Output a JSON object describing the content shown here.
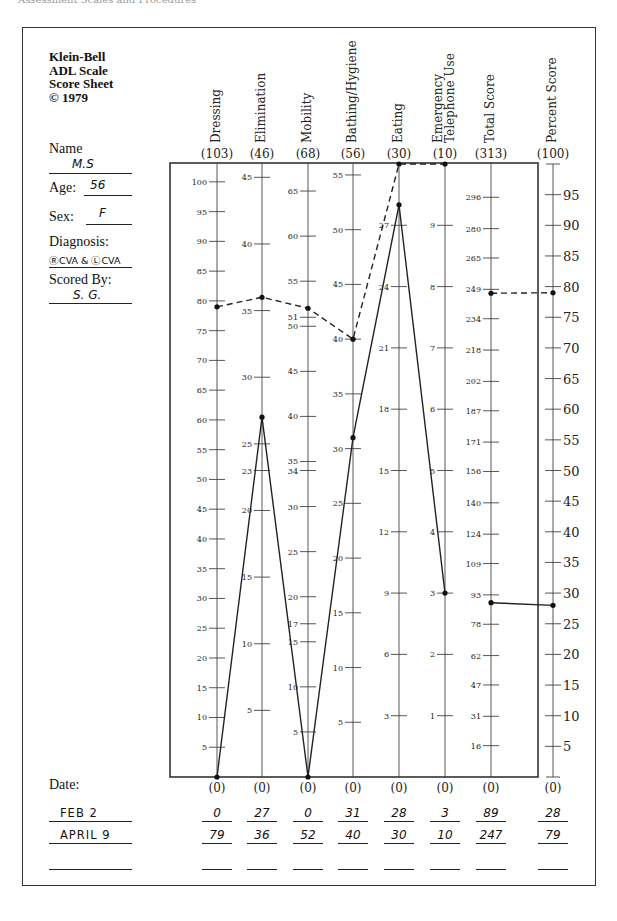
{
  "running_head": "Assessment Scales and Procedures",
  "sheet": {
    "title_lines": [
      "Klein-Bell",
      "ADL Scale",
      "Score Sheet",
      "© 1979"
    ],
    "name_label": "Name",
    "name_value": "M.S",
    "age_label": "Age:",
    "age_value": "56",
    "sex_label": "Sex:",
    "sex_value": "F",
    "diagnosis_label": "Diagnosis:",
    "diagnosis_value": "ⓇCVA & ⓁCVA",
    "scored_by_label": "Scored By:",
    "scored_by_value": "S. G.",
    "date_label": "Date:",
    "zero_label": "(0)"
  },
  "chart_data": {
    "type": "line",
    "title": "Klein-Bell ADL Scale Score Sheet",
    "xlabel": "",
    "ylabel": "",
    "grid": false,
    "legend": "none (rows identified by date at bottom)",
    "categories": [
      "Dressing",
      "Elimination",
      "Mobility",
      "Bathing/Hygiene",
      "Eating",
      "Emergency Telephone Use",
      "Total Score",
      "Percent Score"
    ],
    "maxima": [
      103,
      46,
      68,
      56,
      30,
      10,
      313,
      100
    ],
    "series": [
      {
        "name": "FEB 2",
        "style": "solid",
        "values": [
          0,
          27,
          0,
          31,
          28,
          3,
          89,
          28
        ]
      },
      {
        "name": "APRIL 9",
        "style": "dashed",
        "values": [
          79,
          36,
          52,
          40,
          30,
          10,
          247,
          79
        ]
      }
    ],
    "axes": [
      {
        "label": "Dressing",
        "max_label": "(103)",
        "ticks": [
          5,
          10,
          15,
          20,
          25,
          30,
          35,
          40,
          45,
          50,
          55,
          60,
          65,
          70,
          75,
          80,
          85,
          90,
          95,
          100
        ],
        "tick_side": "left"
      },
      {
        "label": "Elimination",
        "max_label": "(46)",
        "ticks": [
          5,
          10,
          15,
          20,
          23,
          25,
          30,
          35,
          40,
          45
        ],
        "tick_side": "left"
      },
      {
        "label": "Mobility",
        "max_label": "(68)",
        "ticks": [
          5,
          10,
          15,
          17,
          20,
          25,
          30,
          34,
          35,
          40,
          45,
          50,
          51,
          55,
          60,
          65
        ],
        "tick_side": "left"
      },
      {
        "label": "Bathing/Hygiene",
        "max_label": "(56)",
        "ticks": [
          5,
          10,
          15,
          20,
          25,
          30,
          35,
          40,
          45,
          50,
          55
        ],
        "tick_side": "left"
      },
      {
        "label": "Eating",
        "max_label": "(30)",
        "ticks": [
          3,
          6,
          9,
          12,
          15,
          18,
          21,
          24,
          27
        ],
        "tick_side": "left"
      },
      {
        "label": "Emergency Telephone Use",
        "max_label": "(10)",
        "ticks": [
          1,
          2,
          3,
          4,
          5,
          6,
          7,
          8,
          9
        ],
        "tick_side": "left"
      },
      {
        "label": "Total Score",
        "max_label": "(313)",
        "ticks": [
          16,
          31,
          47,
          62,
          78,
          93,
          109,
          124,
          140,
          156,
          171,
          187,
          202,
          218,
          234,
          249,
          265,
          280,
          296
        ],
        "tick_side": "left"
      },
      {
        "label": "Percent Score",
        "max_label": "(100)",
        "ticks": [
          5,
          10,
          15,
          20,
          25,
          30,
          35,
          40,
          45,
          50,
          55,
          60,
          65,
          70,
          75,
          80,
          85,
          90,
          95
        ],
        "tick_side": "right"
      }
    ],
    "ylim": [
      0,
      "column max"
    ]
  },
  "score_rows": [
    {
      "date": "FEB 2",
      "values": [
        "0",
        "27",
        "0",
        "31",
        "28",
        "3",
        "89",
        "28"
      ]
    },
    {
      "date": "APRIL 9",
      "values": [
        "79",
        "36",
        "52",
        "40",
        "30",
        "10",
        "247",
        "79"
      ]
    },
    {
      "date": "",
      "values": [
        "",
        "",
        "",
        "",
        "",
        "",
        "",
        ""
      ]
    }
  ],
  "colors": {
    "ink": "#222222",
    "paper": "#ffffff",
    "frame": "#333333"
  }
}
